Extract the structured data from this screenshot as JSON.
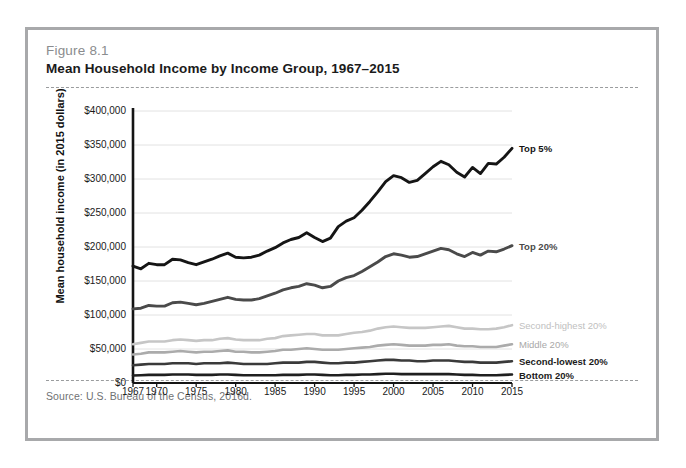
{
  "figure": {
    "number": "Figure 8.1",
    "title": "Mean Household Income by Income Group, 1967–2015",
    "source": "Source: U.S. Bureau of the Census, 2016d."
  },
  "chart_data": {
    "type": "line",
    "title": "Mean Household Income by Income Group, 1967–2015",
    "xlabel": "",
    "ylabel": "Mean household income (in 2015 dollars)",
    "xlim": [
      1967,
      2015
    ],
    "ylim": [
      0,
      400000
    ],
    "yticks": [
      0,
      50000,
      100000,
      150000,
      200000,
      250000,
      300000,
      350000,
      400000
    ],
    "ytick_labels": [
      "$0",
      "$50,000",
      "$100,000",
      "$150,000",
      "$200,000",
      "$250,000",
      "$300,000",
      "$350,000",
      "$400,000"
    ],
    "xticks": [
      1967,
      1970,
      1975,
      1980,
      1985,
      1990,
      1995,
      2000,
      2005,
      2010,
      2015
    ],
    "xtick_labels": [
      "1967",
      "1970",
      "1975",
      "1980",
      "1985",
      "1990",
      "1995",
      "2000",
      "2005",
      "2010",
      "2015"
    ],
    "grid": "horizontal",
    "legend_position": "right-inline",
    "x": [
      1967,
      1968,
      1969,
      1970,
      1971,
      1972,
      1973,
      1974,
      1975,
      1976,
      1977,
      1978,
      1979,
      1980,
      1981,
      1982,
      1983,
      1984,
      1985,
      1986,
      1987,
      1988,
      1989,
      1990,
      1991,
      1992,
      1993,
      1994,
      1995,
      1996,
      1997,
      1998,
      1999,
      2000,
      2001,
      2002,
      2003,
      2004,
      2005,
      2006,
      2007,
      2008,
      2009,
      2010,
      2011,
      2012,
      2013,
      2014,
      2015
    ],
    "series": [
      {
        "name": "Top 5%",
        "color": "#151515",
        "label_color": "#151515",
        "label_bold": true,
        "values": [
          172000,
          168000,
          176000,
          174000,
          174000,
          182000,
          181000,
          177000,
          174000,
          178000,
          182000,
          187000,
          191000,
          185000,
          184000,
          185000,
          188000,
          194000,
          199000,
          206000,
          211000,
          214000,
          221000,
          214000,
          208000,
          213000,
          230000,
          238000,
          243000,
          254000,
          267000,
          281000,
          296000,
          305000,
          302000,
          295000,
          298000,
          308000,
          318000,
          326000,
          321000,
          310000,
          303000,
          317000,
          308000,
          323000,
          322000,
          332000,
          345000
        ]
      },
      {
        "name": "Top 20%",
        "color": "#4a4a4a",
        "label_color": "#4a4a4a",
        "label_bold": true,
        "values": [
          109000,
          110000,
          114000,
          113000,
          113000,
          118000,
          119000,
          117000,
          115000,
          117000,
          120000,
          123000,
          126000,
          123000,
          122000,
          122000,
          124000,
          128000,
          132000,
          137000,
          140000,
          142000,
          146000,
          144000,
          140000,
          142000,
          150000,
          155000,
          158000,
          164000,
          171000,
          178000,
          186000,
          190000,
          188000,
          185000,
          186000,
          190000,
          194000,
          198000,
          196000,
          190000,
          186000,
          192000,
          188000,
          194000,
          193000,
          197000,
          202000
        ]
      },
      {
        "name": "Second-highest 20%",
        "color": "#c6c6c6",
        "label_color": "#c0c0c0",
        "label_bold": false,
        "values": [
          57000,
          59000,
          61000,
          61000,
          61000,
          63000,
          64000,
          63000,
          62000,
          63000,
          63000,
          65000,
          66000,
          64000,
          63000,
          63000,
          63000,
          65000,
          66000,
          69000,
          70000,
          71000,
          72000,
          72000,
          70000,
          70000,
          70000,
          72000,
          74000,
          75000,
          77000,
          80000,
          82000,
          83000,
          82000,
          81000,
          81000,
          81000,
          82000,
          83000,
          84000,
          82000,
          80000,
          80000,
          79000,
          79000,
          80000,
          82000,
          85000
        ]
      },
      {
        "name": "Middle 20%",
        "color": "#ababab",
        "label_color": "#a8a8a8",
        "label_bold": false,
        "values": [
          42000,
          43000,
          45000,
          45000,
          45000,
          46000,
          47000,
          46000,
          45000,
          46000,
          46000,
          47000,
          48000,
          46000,
          46000,
          45000,
          45000,
          46000,
          47000,
          49000,
          49000,
          50000,
          51000,
          50000,
          49000,
          49000,
          49000,
          50000,
          51000,
          52000,
          53000,
          55000,
          56000,
          57000,
          56000,
          55000,
          55000,
          55000,
          56000,
          56000,
          57000,
          55000,
          54000,
          54000,
          53000,
          53000,
          53000,
          55000,
          57000
        ]
      },
      {
        "name": "Second-lowest 20%",
        "color": "#3a3a3a",
        "label_color": "#1b1b1b",
        "label_bold": true,
        "values": [
          26000,
          27000,
          28000,
          28000,
          28000,
          29000,
          29000,
          29000,
          28000,
          29000,
          29000,
          29000,
          30000,
          29000,
          28000,
          28000,
          28000,
          28000,
          29000,
          30000,
          30000,
          30000,
          31000,
          31000,
          30000,
          29000,
          29000,
          30000,
          30000,
          31000,
          32000,
          33000,
          34000,
          34000,
          33000,
          33000,
          32000,
          32000,
          33000,
          33000,
          33000,
          32000,
          31000,
          31000,
          30000,
          30000,
          30000,
          31000,
          32000
        ]
      },
      {
        "name": "Bottom 20%",
        "color": "#1f1f1f",
        "label_color": "#1b1b1b",
        "label_bold": true,
        "values": [
          11000,
          11500,
          12000,
          12000,
          12000,
          12500,
          12500,
          12500,
          12000,
          12000,
          12000,
          12500,
          12500,
          12000,
          11500,
          11500,
          11500,
          11500,
          11500,
          12000,
          12000,
          12000,
          12500,
          12500,
          12000,
          11500,
          11500,
          12000,
          12000,
          12500,
          12500,
          13000,
          13500,
          13500,
          13000,
          13000,
          13000,
          13000,
          13000,
          13000,
          13000,
          12500,
          12000,
          12000,
          11500,
          11500,
          11500,
          12000,
          12500
        ]
      }
    ]
  }
}
